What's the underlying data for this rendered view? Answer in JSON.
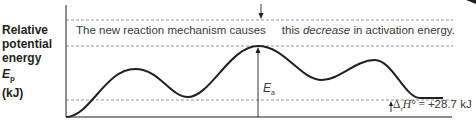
{
  "diagram": {
    "type": "potential-energy-diagram",
    "y_axis_label": {
      "line1": "Relative",
      "line2": "potential",
      "line3": "energy",
      "symbol": "E",
      "symbol_subscript": "p",
      "unit": "(kJ)"
    },
    "annotation": {
      "before": "The new reaction mechanism causes",
      "after_prefix": "this ",
      "emphasis": "decrease",
      "after_suffix": " in activation energy."
    },
    "activation_energy_label": {
      "symbol": "E",
      "subscript": "a"
    },
    "enthalpy_label": {
      "delta": "Δ",
      "subscript": "r",
      "symbol": "H°",
      "equals": " = ",
      "value": "+28.7 kJ"
    },
    "colors": {
      "curve": "#231f20",
      "dashed": "#7a7a7a",
      "text": "#3a3a3a"
    }
  }
}
